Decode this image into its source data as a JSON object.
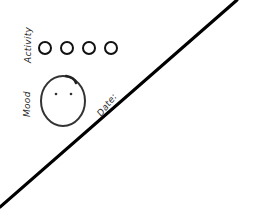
{
  "sketch": {
    "activity": {
      "label": "Activity",
      "options": [
        {
          "id": "activity-1"
        },
        {
          "id": "activity-2"
        },
        {
          "id": "activity-3"
        },
        {
          "id": "activity-4"
        }
      ]
    },
    "mood": {
      "label": "Mood",
      "face_icon": "neutral-face-icon"
    },
    "date": {
      "label": "Date:"
    },
    "divider": {
      "type": "diagonal-line",
      "color": "#000000"
    }
  }
}
